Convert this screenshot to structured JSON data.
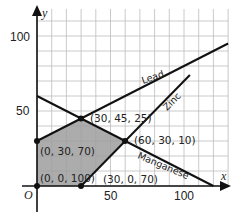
{
  "chart_data": {
    "type": "line",
    "title": "",
    "xlabel": "x",
    "ylabel": "y",
    "origin_label": "O",
    "xlim": [
      0,
      130
    ],
    "ylim": [
      0,
      120
    ],
    "grid": true,
    "grid_step": 10,
    "x_ticks": [
      50,
      100
    ],
    "y_ticks": [
      50,
      100
    ],
    "series": [
      {
        "name": "Lead",
        "equation": "y = 30 + x/2",
        "points": [
          [
            0,
            30
          ],
          [
            30,
            45
          ],
          [
            130,
            95
          ]
        ]
      },
      {
        "name": "Manganese",
        "equation": "y = 60 - x/2",
        "points": [
          [
            0,
            60
          ],
          [
            30,
            45
          ],
          [
            60,
            30
          ],
          [
            120,
            0
          ]
        ]
      },
      {
        "name": "Zinc",
        "equation": "y = x - 30",
        "points": [
          [
            30,
            0
          ],
          [
            60,
            30
          ],
          [
            104,
            74
          ]
        ]
      }
    ],
    "feasible_region": {
      "fill": "#9a9a9a",
      "vertices": [
        [
          0,
          0
        ],
        [
          0,
          30
        ],
        [
          30,
          45
        ],
        [
          60,
          30
        ],
        [
          30,
          0
        ]
      ]
    },
    "annotated_points": [
      {
        "x": 0,
        "y": 0,
        "label": "(0, 0, 100)"
      },
      {
        "x": 0,
        "y": 30,
        "label": "(0, 30, 70)"
      },
      {
        "x": 30,
        "y": 45,
        "label": "(30, 45, 25)"
      },
      {
        "x": 60,
        "y": 30,
        "label": "(60, 30, 10)"
      },
      {
        "x": 30,
        "y": 0,
        "label": "(30, 0, 70)"
      }
    ]
  },
  "labels": {
    "x_axis": "x",
    "y_axis": "y",
    "origin": "O",
    "tick_x_50": "50",
    "tick_x_100": "100",
    "tick_y_50": "50",
    "tick_y_100": "100",
    "lead": "Lead",
    "zinc": "Zinc",
    "manganese": "Manganese",
    "p0": "(0, 0, 100)",
    "p1": "(0, 30, 70)",
    "p2": "(30, 45, 25)",
    "p3": "(60, 30, 10)",
    "p4": "(30, 0, 70)"
  }
}
